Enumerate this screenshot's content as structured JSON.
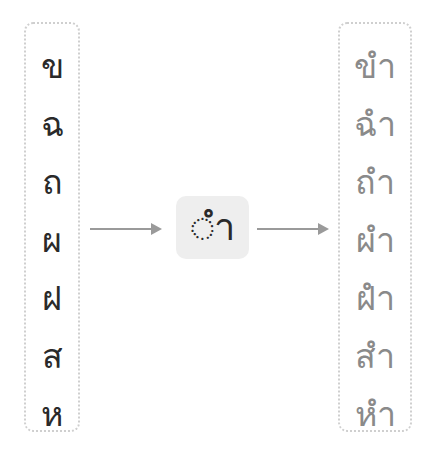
{
  "left_column": {
    "consonants": [
      "ข",
      "ฉ",
      "ถ",
      "ผ",
      "ฝ",
      "ส",
      "ห"
    ]
  },
  "center": {
    "vowel": "◌ำ"
  },
  "right_column": {
    "vowel": "ำ",
    "items": [
      {
        "consonant": "ข",
        "vowel": "ำ"
      },
      {
        "consonant": "ฉ",
        "vowel": "ำ"
      },
      {
        "consonant": "ถ",
        "vowel": "ำ"
      },
      {
        "consonant": "ผ",
        "vowel": "ำ"
      },
      {
        "consonant": "ฝ",
        "vowel": "ำ"
      },
      {
        "consonant": "ส",
        "vowel": "ำ"
      },
      {
        "consonant": "ห",
        "vowel": "ำ"
      }
    ]
  },
  "colors": {
    "consonant_gray": "#8a8a8a",
    "text_dark": "#2a2a2a",
    "arrow": "#9a9a9a",
    "center_box_bg": "#eeeeee",
    "dotted_border": "#cfcfcf"
  }
}
